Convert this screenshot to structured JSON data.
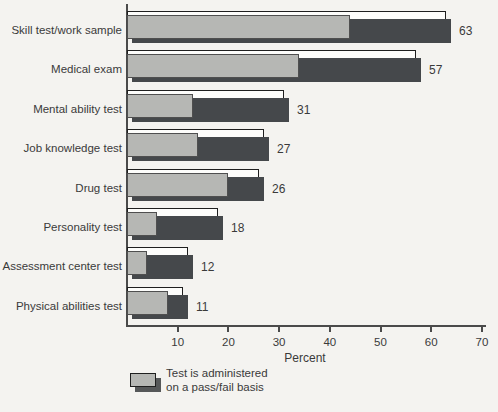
{
  "chart_data": {
    "type": "bar",
    "orientation": "horizontal",
    "title": "",
    "xlabel": "Percent",
    "xlim": [
      0,
      70
    ],
    "xticks": [
      10,
      20,
      30,
      40,
      50,
      60,
      70
    ],
    "grid": false,
    "categories": [
      "Skill test/work sample",
      "Medical exam",
      "Mental ability test",
      "Job knowledge test",
      "Drug test",
      "Personality test",
      "Assessment center test",
      "Physical abilities test"
    ],
    "series": [
      {
        "name": "total",
        "values": [
          63,
          57,
          31,
          27,
          26,
          18,
          12,
          11
        ]
      },
      {
        "name": "pass-fail-basis",
        "values": [
          44,
          34,
          13,
          14,
          20,
          6,
          4,
          8
        ]
      }
    ],
    "value_labels": [
      63,
      57,
      31,
      27,
      26,
      18,
      12,
      11
    ],
    "legend_position": "bottom-left",
    "legend_lines": [
      "Test is administered",
      "on a pass/fail basis"
    ],
    "colors": {
      "total_bar": "#45484b",
      "passfail_bar": "#b6b7b4",
      "back_bar_fill": "#fdfdfb",
      "outline": "#1f1f1f",
      "gray_outline": "#4f4f4f",
      "axis": "#4a4a4a",
      "text": "#3a3a3a",
      "background": "#f4f3f0",
      "legend_shadow": "#565859"
    }
  }
}
